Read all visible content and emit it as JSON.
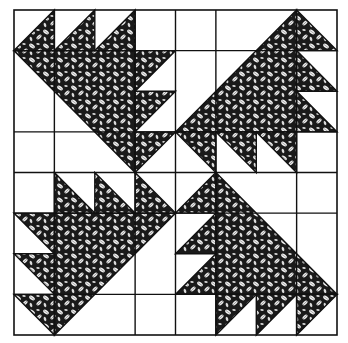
{
  "figure": {
    "grid_units": 8,
    "colors": {
      "background": "#ffffff",
      "line": "#111111",
      "fabric_dark": "#1a1a1a",
      "fabric_light": "#f2f2f2"
    }
  },
  "quadrants": [
    {
      "name": "top-left",
      "big_triangle": [
        [
          0,
          1
        ],
        [
          3,
          1
        ],
        [
          3,
          4
        ]
      ],
      "small_triangles": [
        [
          [
            0,
            1
          ],
          [
            1,
            0
          ],
          [
            1,
            1
          ]
        ],
        [
          [
            1,
            1
          ],
          [
            2,
            0
          ],
          [
            2,
            1
          ]
        ],
        [
          [
            2,
            1
          ],
          [
            3,
            0
          ],
          [
            3,
            1
          ]
        ],
        [
          [
            3,
            1
          ],
          [
            4,
            1
          ],
          [
            3,
            2
          ]
        ],
        [
          [
            3,
            2
          ],
          [
            4,
            2
          ],
          [
            3,
            3
          ]
        ],
        [
          [
            3,
            3
          ],
          [
            4,
            3
          ],
          [
            3,
            4
          ]
        ]
      ]
    },
    {
      "name": "top-right",
      "big_triangle": [
        [
          4,
          3
        ],
        [
          7,
          0
        ],
        [
          7,
          3
        ]
      ],
      "small_triangles": [
        [
          [
            7,
            0
          ],
          [
            8,
            1
          ],
          [
            7,
            1
          ]
        ],
        [
          [
            7,
            1
          ],
          [
            8,
            2
          ],
          [
            7,
            2
          ]
        ],
        [
          [
            7,
            2
          ],
          [
            8,
            3
          ],
          [
            7,
            3
          ]
        ],
        [
          [
            4,
            3
          ],
          [
            5,
            3
          ],
          [
            5,
            4
          ]
        ],
        [
          [
            5,
            3
          ],
          [
            6,
            3
          ],
          [
            6,
            4
          ]
        ],
        [
          [
            6,
            3
          ],
          [
            7,
            3
          ],
          [
            7,
            4
          ]
        ]
      ]
    },
    {
      "name": "bottom-left",
      "big_triangle": [
        [
          1,
          5
        ],
        [
          4,
          5
        ],
        [
          1,
          8
        ]
      ],
      "small_triangles": [
        [
          [
            1,
            4
          ],
          [
            2,
            5
          ],
          [
            1,
            5
          ]
        ],
        [
          [
            2,
            4
          ],
          [
            3,
            5
          ],
          [
            2,
            5
          ]
        ],
        [
          [
            3,
            4
          ],
          [
            4,
            5
          ],
          [
            3,
            5
          ]
        ],
        [
          [
            0,
            5
          ],
          [
            1,
            5
          ],
          [
            1,
            6
          ]
        ],
        [
          [
            0,
            6
          ],
          [
            1,
            6
          ],
          [
            1,
            7
          ]
        ],
        [
          [
            0,
            7
          ],
          [
            1,
            7
          ],
          [
            1,
            8
          ]
        ]
      ]
    },
    {
      "name": "bottom-right",
      "big_triangle": [
        [
          5,
          4
        ],
        [
          8,
          7
        ],
        [
          5,
          7
        ]
      ],
      "small_triangles": [
        [
          [
            4,
            5
          ],
          [
            5,
            5
          ],
          [
            5,
            4
          ]
        ],
        [
          [
            4,
            6
          ],
          [
            5,
            6
          ],
          [
            5,
            5
          ]
        ],
        [
          [
            4,
            7
          ],
          [
            5,
            7
          ],
          [
            5,
            6
          ]
        ],
        [
          [
            5,
            7
          ],
          [
            6,
            7
          ],
          [
            5,
            8
          ]
        ],
        [
          [
            6,
            7
          ],
          [
            7,
            7
          ],
          [
            6,
            8
          ]
        ],
        [
          [
            7,
            7
          ],
          [
            8,
            7
          ],
          [
            7,
            8
          ]
        ]
      ]
    }
  ],
  "grid_lines": {
    "horizontal": [
      1,
      3,
      4,
      5,
      7
    ],
    "vertical": [
      1,
      3,
      4,
      5,
      7
    ]
  }
}
